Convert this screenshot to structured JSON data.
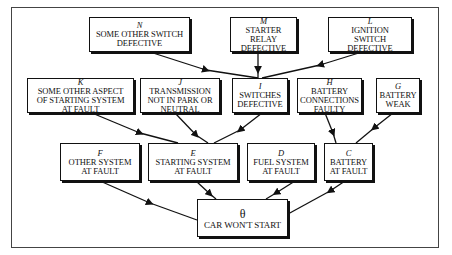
{
  "diagram": {
    "type": "fault-tree",
    "root": {
      "id": "theta",
      "letter": "θ",
      "label": "CAR WON'T START"
    },
    "nodes": {
      "N": {
        "letter": "N",
        "label": "SOME OTHER SWITCH\nDEFECTIVE"
      },
      "M": {
        "letter": "M",
        "label": "STARTER\nRELAY\nDEFECTIVE"
      },
      "L": {
        "letter": "L",
        "label": "IGNITION\nSWITCH\nDEFECTIVE"
      },
      "K": {
        "letter": "K",
        "label": "SOME OTHER ASPECT\nOF STARTING SYSTEM\nAT FAULT"
      },
      "J": {
        "letter": "J",
        "label": "TRANSMISSION\nNOT IN PARK OR\nNEUTRAL"
      },
      "I": {
        "letter": "I",
        "label": "SWITCHES\nDEFECTIVE"
      },
      "H": {
        "letter": "H",
        "label": "BATTERY\nCONNECTIONS\nFAULTY"
      },
      "G": {
        "letter": "G",
        "label": "BATTERY\nWEAK"
      },
      "F": {
        "letter": "F",
        "label": "OTHER SYSTEM\nAT FAULT"
      },
      "E": {
        "letter": "E",
        "label": "STARTING SYSTEM\nAT FAULT"
      },
      "D": {
        "letter": "D",
        "label": "FUEL SYSTEM\nAT FAULT"
      },
      "C": {
        "letter": "C",
        "label": "BATTERY\nAT FAULT"
      }
    },
    "edges": [
      {
        "from": "N",
        "to": "I"
      },
      {
        "from": "M",
        "to": "I"
      },
      {
        "from": "L",
        "to": "I"
      },
      {
        "from": "K",
        "to": "E"
      },
      {
        "from": "J",
        "to": "E"
      },
      {
        "from": "I",
        "to": "E"
      },
      {
        "from": "H",
        "to": "C"
      },
      {
        "from": "G",
        "to": "C"
      },
      {
        "from": "F",
        "to": "theta"
      },
      {
        "from": "E",
        "to": "theta"
      },
      {
        "from": "D",
        "to": "theta"
      },
      {
        "from": "C",
        "to": "theta"
      }
    ]
  }
}
